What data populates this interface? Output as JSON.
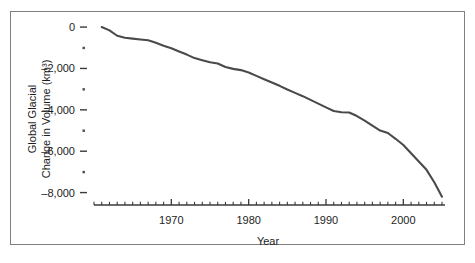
{
  "figure": {
    "top_artifact_text": "",
    "frame_color": "#808080",
    "background": "#ffffff"
  },
  "chart_data": {
    "type": "line",
    "title": "",
    "subtitle": "",
    "xlabel": "Year",
    "ylabel": "Global Glacial Change in Volume (km³)",
    "ylabel_line1": "Global Glacial",
    "ylabel_line2": "Change in Volume (km³)",
    "grid": false,
    "legend": false,
    "legend_position": "none",
    "line_color": "#4a4a4a",
    "xlim": [
      1960,
      2005
    ],
    "ylim": [
      -8600,
      100
    ],
    "xticks": [
      1970,
      1980,
      1990,
      2000
    ],
    "xtick_labels": [
      "1970",
      "1980",
      "1990",
      "2000"
    ],
    "xtick_minor_step": 1,
    "yticks": [
      0,
      -2000,
      -4000,
      -6000,
      -8000
    ],
    "ytick_labels": [
      "0",
      "–2,000",
      "–4,000",
      "–6,000",
      "–8,000"
    ],
    "ytick_minor": [
      -1000,
      -3000,
      -5000,
      -7000
    ],
    "series": [
      {
        "name": "Global Glacial Change in Volume",
        "x": [
          1961,
          1962,
          1963,
          1964,
          1965,
          1966,
          1967,
          1968,
          1969,
          1970,
          1971,
          1972,
          1973,
          1974,
          1975,
          1976,
          1977,
          1978,
          1979,
          1980,
          1981,
          1982,
          1983,
          1984,
          1985,
          1986,
          1987,
          1988,
          1989,
          1990,
          1991,
          1992,
          1993,
          1994,
          1995,
          1996,
          1997,
          1998,
          1999,
          2000,
          2001,
          2002,
          2003,
          2004,
          2005
        ],
        "values": [
          0,
          -160,
          -420,
          -520,
          -560,
          -600,
          -640,
          -760,
          -900,
          -1020,
          -1180,
          -1330,
          -1500,
          -1600,
          -1700,
          -1760,
          -1930,
          -2020,
          -2080,
          -2200,
          -2360,
          -2520,
          -2680,
          -2840,
          -3020,
          -3180,
          -3340,
          -3520,
          -3700,
          -3880,
          -4060,
          -4120,
          -4130,
          -4300,
          -4520,
          -4760,
          -5000,
          -5120,
          -5400,
          -5700,
          -6100,
          -6500,
          -6900,
          -7500,
          -8200
        ]
      }
    ]
  },
  "axes": {
    "x_axis_name": "year-axis",
    "y_axis_name": "volume-axis"
  }
}
